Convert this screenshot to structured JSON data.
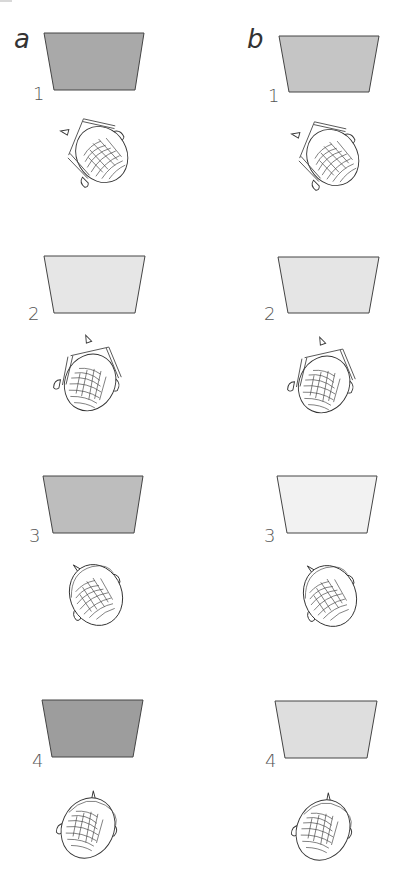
{
  "figure": {
    "columns": [
      {
        "id": "a",
        "label": "a"
      },
      {
        "id": "b",
        "label": "b"
      }
    ],
    "panels": [
      {
        "column": "a",
        "row": 1,
        "number": "1",
        "screen_color": "#a9a9a9",
        "head": "glasses-rotated-left"
      },
      {
        "column": "a",
        "row": 2,
        "number": "2",
        "screen_color": "#e6e6e6",
        "head": "glasses-rotated-right"
      },
      {
        "column": "a",
        "row": 3,
        "number": "3",
        "screen_color": "#bdbdbd",
        "head": "plain-rotated-left"
      },
      {
        "column": "a",
        "row": 4,
        "number": "4",
        "screen_color": "#9d9d9d",
        "head": "plain-rotated-right"
      },
      {
        "column": "b",
        "row": 1,
        "number": "1",
        "screen_color": "#c5c5c5",
        "head": "glasses-rotated-left"
      },
      {
        "column": "b",
        "row": 2,
        "number": "2",
        "screen_color": "#e5e5e5",
        "head": "glasses-rotated-right"
      },
      {
        "column": "b",
        "row": 3,
        "number": "3",
        "screen_color": "#f2f2f2",
        "head": "plain-rotated-left"
      },
      {
        "column": "b",
        "row": 4,
        "number": "4",
        "screen_color": "#dedede",
        "head": "plain-rotated-right"
      }
    ]
  }
}
